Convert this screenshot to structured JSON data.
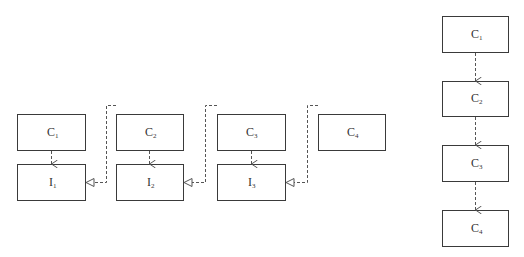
{
  "left_diagram": {
    "components": [
      {
        "id": "C1",
        "base": "C",
        "sub": "1"
      },
      {
        "id": "C2",
        "base": "C",
        "sub": "2"
      },
      {
        "id": "C3",
        "base": "C",
        "sub": "3"
      },
      {
        "id": "C4",
        "base": "C",
        "sub": "4"
      }
    ],
    "interfaces": [
      {
        "id": "I1",
        "base": "I",
        "sub": "1"
      },
      {
        "id": "I2",
        "base": "I",
        "sub": "2"
      },
      {
        "id": "I3",
        "base": "I",
        "sub": "3"
      }
    ],
    "dependencies": [
      {
        "from": "C1",
        "to": "I1",
        "type": "dashed-arrow"
      },
      {
        "from": "C2",
        "to": "I2",
        "type": "dashed-arrow"
      },
      {
        "from": "C3",
        "to": "I3",
        "type": "dashed-arrow"
      }
    ],
    "realizations": [
      {
        "from": "C2",
        "to": "I1",
        "type": "dashed-hollow-triangle"
      },
      {
        "from": "C3",
        "to": "I2",
        "type": "dashed-hollow-triangle"
      },
      {
        "from": "C4",
        "to": "I3",
        "type": "dashed-hollow-triangle"
      }
    ]
  },
  "right_diagram": {
    "components": [
      {
        "id": "C1",
        "base": "C",
        "sub": "1"
      },
      {
        "id": "C2",
        "base": "C",
        "sub": "2"
      },
      {
        "id": "C3",
        "base": "C",
        "sub": "3"
      },
      {
        "id": "C4",
        "base": "C",
        "sub": "4"
      }
    ],
    "dependencies": [
      {
        "from": "C1",
        "to": "C2",
        "type": "dashed-arrow"
      },
      {
        "from": "C2",
        "to": "C3",
        "type": "dashed-arrow"
      },
      {
        "from": "C3",
        "to": "C4",
        "type": "dashed-arrow"
      }
    ]
  }
}
